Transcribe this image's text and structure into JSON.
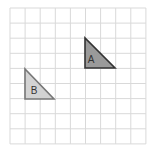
{
  "diagram": {
    "grid": {
      "cols": 9,
      "rows": 9,
      "x0": 10,
      "y0": 8,
      "cell": 15.1,
      "line_color": "#d9d9d9"
    },
    "shapes": [
      {
        "id": "A",
        "label": "A",
        "type": "right-triangle",
        "points": [
          [
            85,
            38
          ],
          [
            85,
            68
          ],
          [
            115,
            68
          ]
        ],
        "fill": "#9a9a9a",
        "stroke": "#333333"
      },
      {
        "id": "B",
        "label": "B",
        "type": "right-triangle",
        "points": [
          [
            25,
            69
          ],
          [
            25,
            99
          ],
          [
            54,
            99
          ]
        ],
        "fill": "#d3d3d3",
        "stroke": "#777777"
      }
    ]
  }
}
